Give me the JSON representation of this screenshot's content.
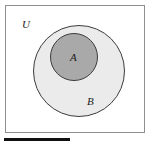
{
  "figure": {
    "type": "venn-diagram",
    "frame": {
      "label": "U",
      "border_color": "#8f8f8f",
      "background_color": "#ffffff"
    },
    "regions": [
      {
        "id": "set-b",
        "label": "B",
        "shape": "circle",
        "fill_color": "#ebebeb",
        "stroke_color": "#3c3c3c"
      },
      {
        "id": "set-a",
        "label": "A",
        "shape": "circle",
        "fill_color": "#a9a9a9",
        "stroke_color": "#3c3c3c"
      }
    ],
    "labels": {
      "universe": "U",
      "inner_set": "A",
      "outer_set": "B"
    },
    "rule": {
      "color": "#111111"
    }
  }
}
